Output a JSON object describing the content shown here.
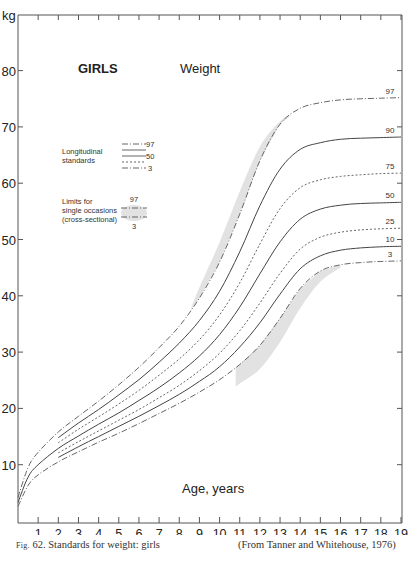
{
  "chart_data": {
    "type": "line",
    "title": "GIRLS",
    "subtitle": "Weight",
    "xlabel": "Age, years",
    "ylabel": "kg",
    "xlim": [
      0,
      19
    ],
    "ylim": [
      0,
      90
    ],
    "x_ticks": [
      1,
      2,
      3,
      4,
      5,
      6,
      7,
      8,
      9,
      10,
      11,
      12,
      13,
      14,
      15,
      16,
      17,
      18,
      19
    ],
    "y_ticks": [
      10,
      20,
      30,
      40,
      50,
      60,
      70,
      80
    ],
    "grid": false,
    "legend": {
      "position": "top-left",
      "longitudinal_label_1": "Longitudinal",
      "longitudinal_label_2": "standards",
      "longitudinal_entries": [
        "97",
        "50",
        "3"
      ],
      "cross_label_1": "Limits for",
      "cross_label_2": "single occasions",
      "cross_label_3": "(cross-sectional)",
      "cross_entries": [
        "97",
        "3"
      ]
    },
    "x": [
      0,
      0.5,
      1,
      2,
      3,
      4,
      5,
      6,
      7,
      8,
      9,
      10,
      11,
      12,
      13,
      14,
      15,
      16,
      17,
      18,
      19
    ],
    "series": [
      {
        "name": "97",
        "style": "dashdot",
        "values": [
          4.2,
          9.5,
          12.2,
          15.8,
          18.6,
          21.3,
          24.2,
          27.3,
          30.8,
          34.6,
          39.6,
          46.0,
          54.5,
          64.0,
          70.5,
          73.3,
          74.3,
          74.8,
          75.0,
          75.1,
          75.2
        ]
      },
      {
        "name": "90",
        "style": "solid",
        "values": [
          null,
          null,
          null,
          14.8,
          17.4,
          19.8,
          22.4,
          25.1,
          28.2,
          31.6,
          35.6,
          40.8,
          47.8,
          56.0,
          62.5,
          66.0,
          67.2,
          67.8,
          68.0,
          68.1,
          68.2
        ]
      },
      {
        "name": "75",
        "style": "dotted",
        "values": [
          null,
          null,
          null,
          13.9,
          16.3,
          18.5,
          20.8,
          23.2,
          25.9,
          28.8,
          32.2,
          36.6,
          42.3,
          49.2,
          55.5,
          59.2,
          60.6,
          61.2,
          61.5,
          61.7,
          61.8
        ]
      },
      {
        "name": "50",
        "style": "solid",
        "values": [
          3.3,
          7.8,
          10.0,
          12.9,
          15.1,
          17.2,
          19.2,
          21.4,
          23.7,
          26.3,
          29.3,
          33.1,
          38.0,
          43.9,
          49.6,
          53.6,
          55.4,
          56.1,
          56.4,
          56.5,
          56.6
        ]
      },
      {
        "name": "25",
        "style": "dotted",
        "values": [
          null,
          null,
          null,
          12.1,
          14.1,
          16.0,
          17.9,
          19.8,
          21.9,
          24.1,
          26.7,
          29.8,
          33.8,
          38.7,
          44.0,
          48.3,
          50.4,
          51.3,
          51.7,
          51.9,
          52.0
        ]
      },
      {
        "name": "10",
        "style": "solid",
        "values": [
          null,
          null,
          null,
          11.3,
          13.2,
          15.0,
          16.8,
          18.6,
          20.5,
          22.5,
          24.8,
          27.4,
          30.9,
          35.2,
          40.3,
          44.8,
          47.1,
          48.1,
          48.5,
          48.7,
          48.8
        ]
      },
      {
        "name": "3",
        "style": "dashdot",
        "values": [
          2.6,
          6.3,
          8.2,
          10.5,
          12.3,
          14.0,
          15.6,
          17.3,
          19.1,
          20.9,
          22.9,
          25.1,
          27.8,
          31.2,
          36.0,
          41.3,
          44.4,
          45.5,
          45.9,
          46.1,
          46.2
        ]
      }
    ],
    "cross_sectional_limits": {
      "upper": {
        "x": [
          8.5,
          9,
          10,
          11,
          12,
          13,
          13.6
        ],
        "values": [
          37.0,
          41.5,
          49.5,
          58.5,
          66.5,
          71.0,
          72.2
        ]
      },
      "lower": {
        "x": [
          10.8,
          11,
          12,
          13,
          14,
          15,
          16
        ],
        "values": [
          23.8,
          24.4,
          27.0,
          31.8,
          37.8,
          42.5,
          45.0
        ]
      }
    },
    "caption_left_prefix": "Fig.",
    "caption_left": "62. Standards for weight: girls",
    "caption_right": "(From Tanner and Whitehouse, 1976)"
  }
}
